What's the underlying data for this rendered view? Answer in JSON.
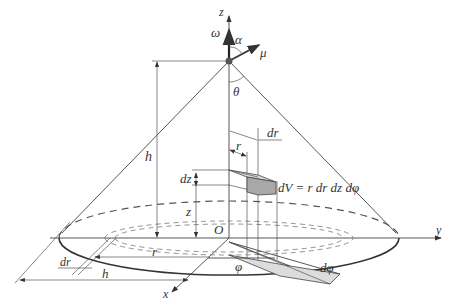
{
  "axes": {
    "z_label": "z",
    "y_label": "y",
    "x_label": "x",
    "origin_label": "O"
  },
  "vectors": {
    "omega": "ω⃗",
    "mu": "μ⃗"
  },
  "angles": {
    "alpha": "α",
    "theta": "θ",
    "phi": "φ",
    "dphi": "dφ"
  },
  "dimensions": {
    "h_vertical": "h",
    "h_radius": "h",
    "r_top": "r",
    "dr_top": "dr",
    "r_base": "r",
    "dr_base": "dr",
    "dz": "dz",
    "z": "z"
  },
  "formula": "dV = r dr dz dφ",
  "colors": {
    "lines": "#444444",
    "shaded": "#aaaaaa",
    "shaded_light": "#d8d8d8",
    "apex": "#555555"
  }
}
